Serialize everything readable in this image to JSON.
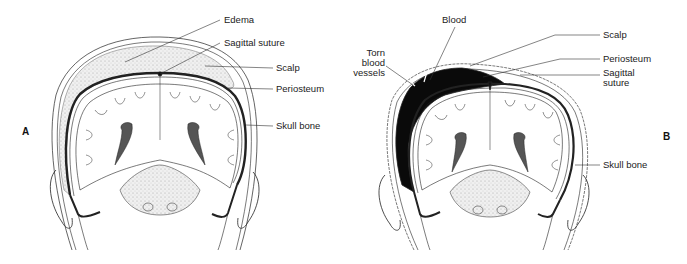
{
  "panels": [
    {
      "id": "A",
      "letter": "A",
      "labels": {
        "edema": "Edema",
        "sagittal_suture": "Sagittal suture",
        "scalp": "Scalp",
        "periosteum": "Periosteum",
        "skull_bone": "Skull bone"
      }
    },
    {
      "id": "B",
      "letter": "B",
      "labels": {
        "blood": "Blood",
        "torn_vessels": "Torn\nblood\nvessels",
        "scalp": "Scalp",
        "periosteum": "Periosteum",
        "sagittal_suture": "Sagittal\nsuture",
        "skull_bone": "Skull bone"
      }
    }
  ],
  "colors": {
    "line": "#222222",
    "edema_fill": "#e6e6e6",
    "blood_fill": "#0a0a0a",
    "brain_fill": "#ffffff",
    "tissue_fill": "#f2f2f2"
  }
}
